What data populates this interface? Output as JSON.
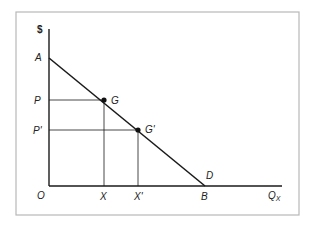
{
  "diagram": {
    "type": "demand-curve",
    "frame_color": "#b8b8b8",
    "line_color": "#1a1a1a",
    "y_axis_label": "$",
    "x_axis_label": "Q",
    "x_axis_label_sub": "X",
    "origin_label": "O",
    "points": {
      "A": {
        "label": "A"
      },
      "G": {
        "label": "G"
      },
      "G_prime": {
        "label": "G'"
      },
      "D": {
        "label": "D"
      },
      "B": {
        "label": "B"
      }
    },
    "y_ticks": [
      {
        "label": "P"
      },
      {
        "label": "P'"
      }
    ],
    "x_ticks": [
      {
        "label": "X"
      },
      {
        "label": "X'"
      }
    ]
  }
}
